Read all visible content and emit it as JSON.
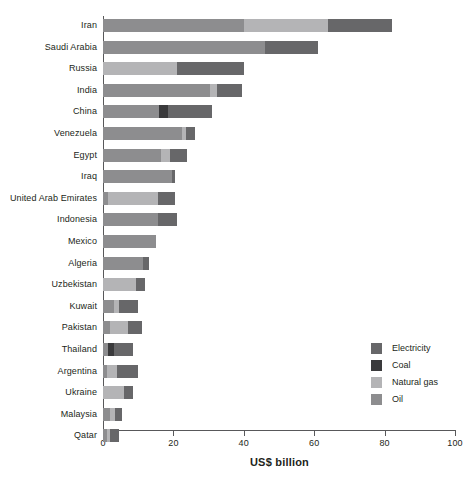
{
  "chart_data": {
    "type": "bar",
    "orientation": "horizontal",
    "stacked": true,
    "title": "",
    "xlabel": "US$ billion",
    "ylabel": "",
    "xlim": [
      0,
      100
    ],
    "xticks": [
      0,
      20,
      40,
      60,
      80,
      100
    ],
    "grid": false,
    "legend_position": "right-inside",
    "categories": [
      "Iran",
      "Saudi Arabia",
      "Russia",
      "India",
      "China",
      "Venezuela",
      "Egypt",
      "Iraq",
      "United Arab Emirates",
      "Indonesia",
      "Mexico",
      "Algeria",
      "Uzbekistan",
      "Kuwait",
      "Pakistan",
      "Thailand",
      "Argentina",
      "Ukraine",
      "Malaysia",
      "Qatar"
    ],
    "series": [
      {
        "name": "Oil",
        "color": "#8d8d8f",
        "values": [
          40.0,
          46.0,
          0.0,
          30.5,
          16.0,
          22.5,
          16.5,
          19.5,
          1.5,
          15.5,
          15.0,
          11.5,
          0.0,
          3.0,
          2.0,
          1.5,
          1.0,
          0.0,
          2.0,
          1.0
        ]
      },
      {
        "name": "Natural gas",
        "color": "#b4b4b6",
        "values": [
          24.0,
          0.0,
          21.0,
          2.0,
          0.0,
          1.0,
          2.5,
          0.0,
          14.0,
          0.0,
          0.0,
          0.0,
          9.5,
          1.5,
          5.0,
          0.0,
          3.0,
          6.0,
          1.5,
          1.0
        ]
      },
      {
        "name": "Coal",
        "color": "#3a3a3c",
        "values": [
          0.0,
          0.0,
          0.0,
          0.0,
          2.5,
          0.0,
          0.0,
          0.0,
          0.0,
          0.0,
          0.0,
          0.0,
          0.0,
          0.0,
          0.0,
          1.5,
          0.0,
          0.0,
          0.0,
          0.0
        ]
      },
      {
        "name": "Electricity",
        "color": "#676769",
        "values": [
          18.0,
          15.0,
          19.0,
          7.0,
          12.5,
          2.5,
          5.0,
          1.0,
          5.0,
          5.5,
          0.0,
          1.5,
          2.5,
          5.5,
          4.0,
          5.5,
          6.0,
          2.5,
          2.0,
          2.5
        ]
      }
    ],
    "totals": [
      82.0,
      61.0,
      40.0,
      39.5,
      31.0,
      26.0,
      24.0,
      20.5,
      20.5,
      21.0,
      15.0,
      13.0,
      12.0,
      10.0,
      11.0,
      8.5,
      10.0,
      8.5,
      5.5,
      4.5
    ],
    "legend_order": [
      "Electricity",
      "Coal",
      "Natural gas",
      "Oil"
    ]
  }
}
